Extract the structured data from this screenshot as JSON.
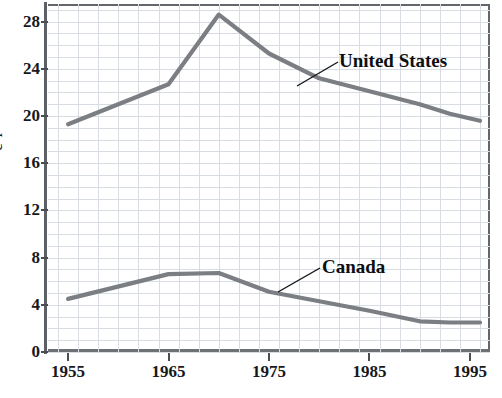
{
  "chart_data": {
    "type": "line",
    "title": "",
    "subtitle": "",
    "xlabel": "",
    "ylabel": "",
    "ylabel_cropped_text": "c r",
    "xlim": [
      1953,
      1997
    ],
    "ylim": [
      0,
      29.5
    ],
    "xticks": [
      1955,
      1965,
      1975,
      1985,
      1995
    ],
    "xtick_labels": [
      "1955",
      "1965",
      "1975",
      "1985",
      "1995"
    ],
    "yticks": [
      0,
      4,
      8,
      12,
      16,
      20,
      24,
      28
    ],
    "ytick_labels": [
      "0",
      "4",
      "8",
      "12",
      "16",
      "20",
      "24",
      "28"
    ],
    "grid": true,
    "grid_x_step": 2,
    "grid_y_step": 1,
    "legend_position": "inline-annotations",
    "line_color": "#7b7e83",
    "grid_color": "#d8dde4",
    "axis_color": "#5d6065",
    "series": [
      {
        "name": "United States",
        "label": "United States",
        "color": "#7b7e83",
        "x": [
          1955,
          1965,
          1970,
          1975,
          1980,
          1985,
          1990,
          1993,
          1996
        ],
        "values": [
          19.3,
          22.7,
          28.6,
          25.3,
          23.2,
          22.1,
          21.0,
          20.2,
          19.6
        ]
      },
      {
        "name": "Canada",
        "label": "Canada",
        "color": "#7b7e83",
        "x": [
          1955,
          1965,
          1970,
          1975,
          1980,
          1985,
          1990,
          1993,
          1996
        ],
        "values": [
          4.5,
          6.6,
          6.7,
          5.1,
          4.3,
          3.5,
          2.6,
          2.5,
          2.5
        ]
      }
    ]
  },
  "annotations": {
    "united_states": {
      "label": "United States",
      "leader_from": [
        338,
        62
      ],
      "leader_to": [
        297,
        86
      ]
    },
    "canada": {
      "label": "Canada",
      "leader_from": [
        320,
        268
      ],
      "leader_to": [
        278,
        292
      ]
    }
  }
}
